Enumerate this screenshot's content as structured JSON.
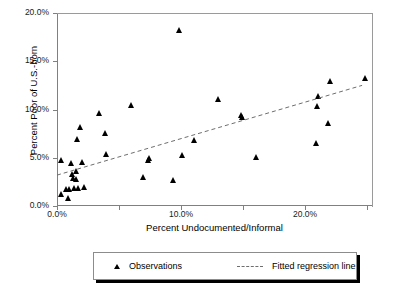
{
  "chart_data": {
    "type": "scatter",
    "title": "",
    "xlabel": "Percent Undocumented/Informal",
    "ylabel": "Percent Poor of U.S.-born",
    "xlim": [
      0,
      25.4
    ],
    "ylim": [
      0,
      20
    ],
    "grid": false,
    "legend_position": "bottom",
    "x_tick_labels": [
      "0.0%",
      "10.0%",
      "20.0%"
    ],
    "x_tick_label_values": [
      0,
      10,
      20
    ],
    "x_tick_values": [
      0,
      5,
      10,
      15,
      20,
      25
    ],
    "y_tick_labels": [
      "0.0%",
      "5.0%",
      "10.0%",
      "15.0%",
      "20.0%"
    ],
    "y_tick_values": [
      0,
      5,
      10,
      15,
      20
    ],
    "series": [
      {
        "name": "Observations",
        "marker": "triangle",
        "color": "#000000",
        "points": [
          [
            0.35,
            4.8
          ],
          [
            0.4,
            1.2
          ],
          [
            0.8,
            1.8
          ],
          [
            1.0,
            1.8
          ],
          [
            0.9,
            0.8
          ],
          [
            1.2,
            4.4
          ],
          [
            1.25,
            3.3
          ],
          [
            1.3,
            2.9
          ],
          [
            1.45,
            1.9
          ],
          [
            1.55,
            3.6
          ],
          [
            1.6,
            2.8
          ],
          [
            1.7,
            6.9
          ],
          [
            1.75,
            1.9
          ],
          [
            1.9,
            8.2
          ],
          [
            2.1,
            4.6
          ],
          [
            2.2,
            2.0
          ],
          [
            3.4,
            9.6
          ],
          [
            3.9,
            7.6
          ],
          [
            4.0,
            5.4
          ],
          [
            6.0,
            10.5
          ],
          [
            7.0,
            3.0
          ],
          [
            7.4,
            4.8
          ],
          [
            7.5,
            5.0
          ],
          [
            9.4,
            2.7
          ],
          [
            9.9,
            18.2
          ],
          [
            10.1,
            5.3
          ],
          [
            11.1,
            6.8
          ],
          [
            13.0,
            11.1
          ],
          [
            14.9,
            9.4
          ],
          [
            15.0,
            9.2
          ],
          [
            16.1,
            5.1
          ],
          [
            20.9,
            6.5
          ],
          [
            21.0,
            10.4
          ],
          [
            21.1,
            11.4
          ],
          [
            21.9,
            8.6
          ],
          [
            22.1,
            12.9
          ],
          [
            24.9,
            13.3
          ]
        ]
      },
      {
        "name": "Fitted regression line",
        "type": "line",
        "style": "dashed",
        "color": "#6e6e6e",
        "endpoints": [
          [
            0,
            3.2
          ],
          [
            24.6,
            12.5
          ]
        ],
        "slope_per_percent": 0.378,
        "intercept": 3.2
      }
    ]
  },
  "axes": {
    "y_title": "Percent Poor of U.S.-born",
    "x_title": "Percent Undocumented/Informal"
  },
  "legend": {
    "observations_label": "Observations",
    "fit_label": "Fitted regression line"
  }
}
